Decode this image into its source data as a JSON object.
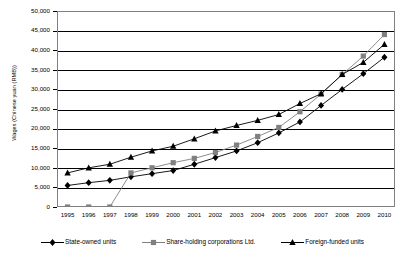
{
  "chart_data": {
    "type": "line",
    "title": "",
    "xlabel": "",
    "ylabel": "Wages (Chinese yuan (RMB))",
    "categories": [
      "1995",
      "1996",
      "1997",
      "1998",
      "1999",
      "2000",
      "2001",
      "2002",
      "2003",
      "2004",
      "2005",
      "2006",
      "2007",
      "2008",
      "2009",
      "2010"
    ],
    "ylim": [
      0,
      50000
    ],
    "ytick_values": [
      0,
      5000,
      10000,
      15000,
      20000,
      25000,
      30000,
      35000,
      40000,
      45000,
      50000
    ],
    "ytick_labels": [
      "0",
      "5,000",
      "10,000",
      "15,000",
      "20,000",
      "25,000",
      "30,000",
      "35,000",
      "40,000",
      "45,000",
      "50,000"
    ],
    "grid": "horizontal",
    "legend_position": "bottom",
    "series": [
      {
        "name": "State-owned units",
        "marker": "diamond",
        "color": "#000000",
        "values": [
          5500,
          6200,
          6800,
          7700,
          8500,
          9300,
          10900,
          12600,
          14300,
          16400,
          18900,
          21700,
          25900,
          30000,
          34000,
          38200
        ]
      },
      {
        "name": "Share-holding corporations Ltd.",
        "marker": "square",
        "color": "#808080",
        "values": [
          0,
          0,
          0,
          8700,
          10000,
          11300,
          12400,
          13900,
          15800,
          18000,
          20300,
          24300,
          28800,
          33800,
          38500,
          44000
        ]
      },
      {
        "name": "Foreign-funded units",
        "marker": "triangle",
        "color": "#000000",
        "values": [
          8700,
          10000,
          10900,
          12700,
          14300,
          15500,
          17400,
          19400,
          20800,
          22100,
          23600,
          26400,
          28900,
          33800,
          36900,
          41500
        ]
      }
    ]
  },
  "legend": {
    "items": [
      {
        "label": "State-owned units"
      },
      {
        "label": "Share-holding corporations Ltd."
      },
      {
        "label": "Foreign-funded units"
      }
    ]
  }
}
